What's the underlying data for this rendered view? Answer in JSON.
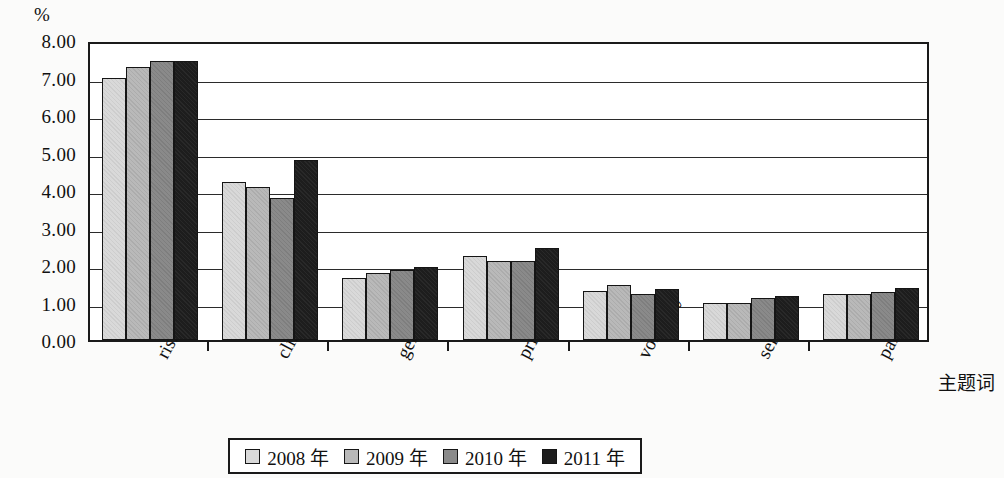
{
  "chart_data": {
    "type": "bar",
    "title": "",
    "xlabel": "主题词",
    "ylabel": "%",
    "ylim": [
      0,
      8
    ],
    "ytick_labels": [
      "0.00",
      "1.00",
      "2.00",
      "3.00",
      "4.00",
      "5.00",
      "6.00",
      "7.00",
      "8.00"
    ],
    "ytick_values": [
      0,
      1,
      2,
      3,
      4,
      5,
      6,
      7,
      8
    ],
    "grid": true,
    "legend_position": "bottom",
    "categories": [
      "risk",
      "clinic",
      "gene",
      "price",
      "volatility",
      "service",
      "particle"
    ],
    "series": [
      {
        "name": "2008 年",
        "color": "#d9d9d9",
        "values": [
          6.98,
          4.22,
          1.65,
          2.23,
          1.3,
          1.0,
          1.23
        ]
      },
      {
        "name": "2009 年",
        "color": "#b9b9b9",
        "values": [
          7.28,
          4.08,
          1.8,
          2.12,
          1.48,
          1.0,
          1.22
        ]
      },
      {
        "name": "2010 年",
        "color": "#8a8a8a",
        "values": [
          7.43,
          3.78,
          1.88,
          2.1,
          1.22,
          1.13,
          1.28
        ]
      },
      {
        "name": "2011 年",
        "color": "#1d1d1d",
        "values": [
          7.43,
          4.8,
          1.96,
          2.45,
          1.35,
          1.17,
          1.4
        ]
      }
    ]
  }
}
